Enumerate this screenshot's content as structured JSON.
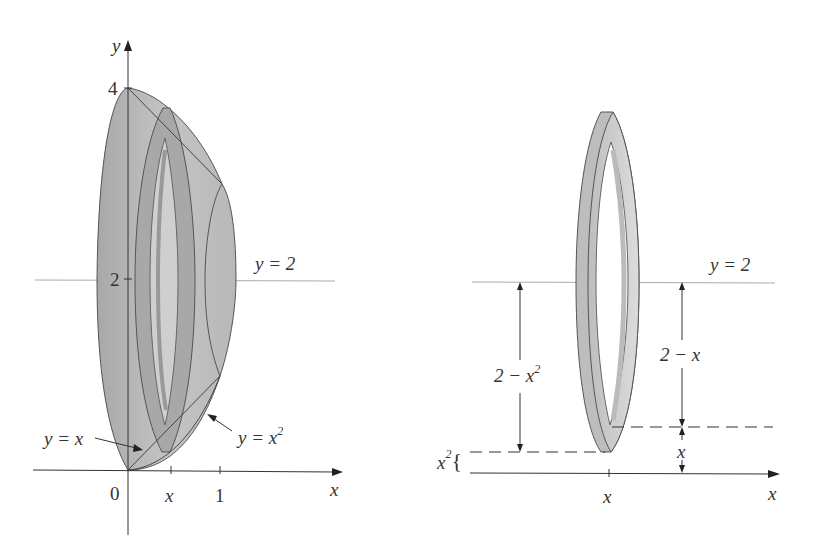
{
  "left_figure": {
    "axis_y_label": "y",
    "axis_x_label": "x",
    "tick_4": "4",
    "tick_2": "2",
    "origin": "0",
    "tick_x": "x",
    "tick_1": "1",
    "line_label": "y = 2",
    "curve_linear": "y = x",
    "curve_parabola_base": "y = x",
    "curve_parabola_exp": "2"
  },
  "right_figure": {
    "line_label": "y = 2",
    "outer_radius_base": "2 − x",
    "outer_radius_exp": "2",
    "inner_radius": "2 − x",
    "small_gap": "x",
    "bottom_gap_base": "x",
    "bottom_gap_exp": "2",
    "bottom_gap_brace": "{",
    "tick_x": "x",
    "axis_x_label": "x"
  },
  "colors": {
    "solid_fill": "#b4b4b4",
    "solid_dark": "#8f8f8f",
    "ring_light": "#cfcfcf",
    "line": "#555555",
    "guide": "#aaaaaa"
  }
}
